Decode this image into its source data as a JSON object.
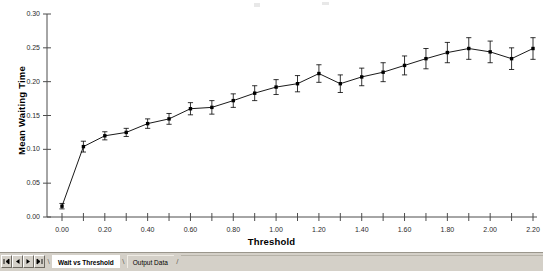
{
  "chart_data": {
    "type": "line",
    "title": "",
    "subtitle": "",
    "xlabel": "Threshold",
    "ylabel": "Mean Waiting Time",
    "xlim": [
      0.0,
      2.2
    ],
    "ylim": [
      0.0,
      0.3
    ],
    "grid": false,
    "legend": null,
    "error_bars": true,
    "marker": "square",
    "line_color": "#000000",
    "x": [
      0.0,
      0.1,
      0.2,
      0.3,
      0.4,
      0.5,
      0.6,
      0.7,
      0.8,
      0.9,
      1.0,
      1.1,
      1.2,
      1.3,
      1.4,
      1.5,
      1.6,
      1.7,
      1.8,
      1.9,
      2.0,
      2.1,
      2.2
    ],
    "values": [
      0.016,
      0.104,
      0.12,
      0.125,
      0.138,
      0.145,
      0.16,
      0.162,
      0.172,
      0.183,
      0.192,
      0.197,
      0.212,
      0.197,
      0.207,
      0.214,
      0.224,
      0.234,
      0.243,
      0.249,
      0.244,
      0.234,
      0.249
    ],
    "errors": [
      0.004,
      0.008,
      0.006,
      0.006,
      0.007,
      0.008,
      0.009,
      0.01,
      0.01,
      0.011,
      0.011,
      0.012,
      0.013,
      0.013,
      0.013,
      0.014,
      0.014,
      0.015,
      0.015,
      0.016,
      0.016,
      0.016,
      0.016
    ],
    "x_ticks": [
      0.0,
      0.1,
      0.2,
      0.3,
      0.4,
      0.5,
      0.6,
      0.7,
      0.8,
      0.9,
      1.0,
      1.1,
      1.2,
      1.3,
      1.4,
      1.5,
      1.6,
      1.7,
      1.8,
      1.9,
      2.0,
      2.1,
      2.2
    ],
    "x_tick_labels": [
      "0.00",
      "",
      "0.20",
      "",
      "0.40",
      "",
      "0.60",
      "",
      "0.80",
      "",
      "1.00",
      "",
      "1.20",
      "",
      "1.40",
      "",
      "1.60",
      "",
      "1.80",
      "",
      "2.00",
      "",
      "2.20"
    ],
    "y_ticks": [
      0.0,
      0.05,
      0.1,
      0.15,
      0.2,
      0.25,
      0.3
    ],
    "y_tick_labels": [
      "0.00",
      "0.05",
      "0.10",
      "0.15",
      "0.20",
      "0.25",
      "0.30"
    ]
  },
  "sheet_bar": {
    "nav": {
      "first_label": "first-sheet",
      "prev_label": "previous-sheet",
      "next_label": "next-sheet",
      "last_label": "last-sheet"
    },
    "tabs": [
      {
        "label": "Wait vs Threshold",
        "active": true
      },
      {
        "label": "Output Data",
        "active": false
      }
    ]
  }
}
